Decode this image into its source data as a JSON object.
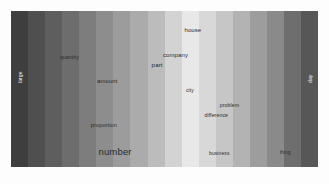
{
  "figure": {
    "type": "word-cloud-banded-strip",
    "panel": {
      "background_bands": [
        "#3e3e3e",
        "#4f4f4f",
        "#5e5e5e",
        "#6d6d6d",
        "#7d7d7d",
        "#8d8d8d",
        "#9c9c9c",
        "#ababab",
        "#bcbcbc",
        "#d3d3d3",
        "#e8e8e8",
        "#d8d8d8",
        "#c6c6c6",
        "#b3b3b3",
        "#9d9d9d",
        "#8a8a8a",
        "#6e6e6e",
        "#575757"
      ]
    },
    "words": [
      {
        "text": "large",
        "x": 2.2,
        "y": 46.0,
        "size": 5.0,
        "rotated": true,
        "edge": true
      },
      {
        "text": "quantity",
        "x": 16.0,
        "y": 28.5,
        "size": 5.2,
        "rotated": false,
        "edge": false
      },
      {
        "text": "amount",
        "x": 28.0,
        "y": 43.0,
        "size": 6.0,
        "rotated": false,
        "edge": false
      },
      {
        "text": "proportion",
        "x": 26.0,
        "y": 71.5,
        "size": 5.6,
        "rotated": false,
        "edge": false
      },
      {
        "text": "number",
        "x": 28.5,
        "y": 87.0,
        "size": 9.6,
        "rotated": false,
        "edge": false
      },
      {
        "text": "house",
        "x": 56.5,
        "y": 10.5,
        "size": 6.0,
        "rotated": false,
        "edge": false
      },
      {
        "text": "company",
        "x": 49.5,
        "y": 26.0,
        "size": 6.0,
        "rotated": false,
        "edge": false
      },
      {
        "text": "part",
        "x": 45.8,
        "y": 33.0,
        "size": 6.2,
        "rotated": false,
        "edge": false
      },
      {
        "text": "city",
        "x": 57.0,
        "y": 49.5,
        "size": 5.0,
        "rotated": false,
        "edge": false
      },
      {
        "text": "problem",
        "x": 68.0,
        "y": 59.0,
        "size": 5.2,
        "rotated": false,
        "edge": false
      },
      {
        "text": "difference",
        "x": 63.0,
        "y": 65.5,
        "size": 5.2,
        "rotated": false,
        "edge": false
      },
      {
        "text": "business",
        "x": 64.5,
        "y": 90.0,
        "size": 5.0,
        "rotated": false,
        "edge": false
      },
      {
        "text": "thing",
        "x": 87.5,
        "y": 90.0,
        "size": 4.8,
        "rotated": false,
        "edge": false
      },
      {
        "text": "day",
        "x": 96.6,
        "y": 46.0,
        "size": 5.0,
        "rotated": true,
        "edge": true
      }
    ],
    "captions": {
      "left": "",
      "center": "",
      "right": ""
    }
  }
}
